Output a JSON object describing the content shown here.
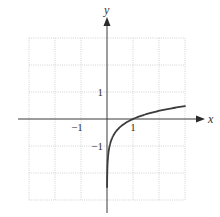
{
  "chart_data": {
    "type": "line",
    "title": "",
    "function": "y = log10(x)",
    "xlabel": "x",
    "ylabel": "y",
    "xlim": [
      -3,
      3
    ],
    "ylim": [
      -3,
      3
    ],
    "grid": true,
    "grid_step": 1,
    "x_tick_labels": [
      {
        "value": -1,
        "label": "−1"
      },
      {
        "value": 1,
        "label": "1"
      }
    ],
    "y_tick_labels": [
      {
        "value": 1,
        "label": "1"
      },
      {
        "value": -1,
        "label": "−1"
      }
    ],
    "series": [
      {
        "name": "y = log10(x)",
        "x": [
          0.003,
          0.01,
          0.05,
          0.1,
          0.2,
          0.4,
          0.6,
          0.8,
          1,
          1.5,
          2,
          2.5,
          3
        ],
        "y": [
          -2.52,
          -2.0,
          -1.3,
          -1.0,
          -0.7,
          -0.4,
          -0.22,
          -0.1,
          0,
          0.18,
          0.3,
          0.4,
          0.48
        ]
      }
    ],
    "legend": null
  },
  "axes": {
    "x_label": "x",
    "y_label": "y"
  },
  "colors": {
    "curve": "#3c3c3c",
    "axis": "#3a3a3a",
    "grid": "#c8c8c8"
  }
}
